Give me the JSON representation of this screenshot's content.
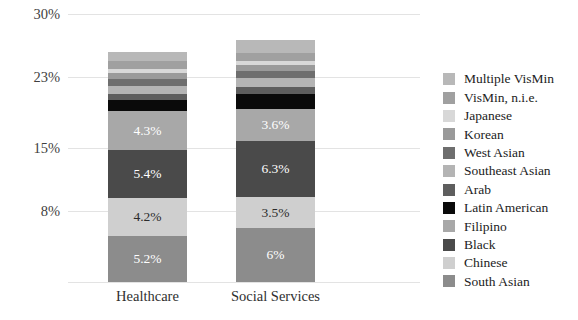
{
  "chart_data": {
    "type": "bar",
    "subtype": "stacked-bar",
    "title": "",
    "xlabel": "",
    "ylabel": "",
    "categories": [
      "Healthcare",
      "Social Services"
    ],
    "ylim": [
      0,
      30
    ],
    "yticks": [
      30,
      23,
      15,
      8
    ],
    "ytick_labels": [
      "30%",
      "23%",
      "15%",
      "8%"
    ],
    "grid": true,
    "legend_position": "right",
    "legend_order": "top-to-bottom is reverse of stacking order",
    "series": [
      {
        "name": "South Asian",
        "color": "#8c8c8c",
        "values": [
          5.2,
          6.0
        ],
        "labels": [
          "5.2%",
          "6%"
        ],
        "label_color": "#ffffff"
      },
      {
        "name": "Chinese",
        "color": "#cfcfcf",
        "values": [
          4.2,
          3.5
        ],
        "labels": [
          "4.2%",
          "3.5%"
        ],
        "label_color": "#2b2b2b"
      },
      {
        "name": "Black",
        "color": "#4a4a4a",
        "values": [
          5.4,
          6.3
        ],
        "labels": [
          "5.4%",
          "6.3%"
        ],
        "label_color": "#ffffff"
      },
      {
        "name": "Filipino",
        "color": "#a8a8a8",
        "values": [
          4.3,
          3.6
        ],
        "labels": [
          "4.3%",
          "3.6%"
        ],
        "label_color": "#ffffff"
      },
      {
        "name": "Latin American",
        "color": "#0a0a0a",
        "values": [
          1.3,
          1.6
        ],
        "labels": [
          "",
          ""
        ],
        "label_color": "#ffffff"
      },
      {
        "name": "Arab",
        "color": "#5e5e5e",
        "values": [
          0.7,
          0.8
        ],
        "labels": [
          "",
          ""
        ],
        "label_color": "#ffffff"
      },
      {
        "name": "Southeast Asian",
        "color": "#b4b4b4",
        "values": [
          0.9,
          1.0
        ],
        "labels": [
          "",
          ""
        ],
        "label_color": "#ffffff"
      },
      {
        "name": "West Asian",
        "color": "#6e6e6e",
        "values": [
          0.7,
          0.8
        ],
        "labels": [
          "",
          ""
        ],
        "label_color": "#ffffff"
      },
      {
        "name": "Korean",
        "color": "#9a9a9a",
        "values": [
          0.7,
          0.7
        ],
        "labels": [
          "",
          ""
        ],
        "label_color": "#ffffff"
      },
      {
        "name": "Japanese",
        "color": "#d8d8d8",
        "values": [
          0.5,
          0.5
        ],
        "labels": [
          "",
          ""
        ],
        "label_color": "#2b2b2b"
      },
      {
        "name": "VisMin, n.i.e.",
        "color": "#a0a0a0",
        "values": [
          0.9,
          0.9
        ],
        "labels": [
          "",
          ""
        ],
        "label_color": "#ffffff"
      },
      {
        "name": "Multiple VisMin",
        "color": "#b8b8b8",
        "values": [
          0.9,
          1.4
        ],
        "labels": [
          "",
          ""
        ],
        "label_color": "#ffffff"
      }
    ],
    "totals": [
      25.7,
      27.1
    ],
    "legend_entries": [
      {
        "label": "Multiple VisMin",
        "color": "#b8b8b8"
      },
      {
        "label": "VisMin, n.i.e.",
        "color": "#a0a0a0"
      },
      {
        "label": "Japanese",
        "color": "#d8d8d8"
      },
      {
        "label": "Korean",
        "color": "#9a9a9a"
      },
      {
        "label": "West Asian",
        "color": "#6e6e6e"
      },
      {
        "label": "Southeast Asian",
        "color": "#b4b4b4"
      },
      {
        "label": "Arab",
        "color": "#5e5e5e"
      },
      {
        "label": "Latin American",
        "color": "#0a0a0a"
      },
      {
        "label": "Filipino",
        "color": "#a8a8a8"
      },
      {
        "label": "Black",
        "color": "#4a4a4a"
      },
      {
        "label": "Chinese",
        "color": "#cfcfcf"
      },
      {
        "label": "South Asian",
        "color": "#8c8c8c"
      }
    ],
    "colors": {
      "background": "#ffffff",
      "gridline": "#e3e3e3",
      "axis_text": "#3f3f3f",
      "legend_text": "#222222"
    }
  }
}
